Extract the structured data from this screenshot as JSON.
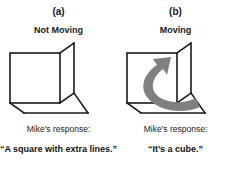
{
  "figure": {
    "background_color": "#ffffff",
    "line_color": "#1a1a1a",
    "arrow_color": "#808080"
  },
  "panels": [
    {
      "letter": "(a)",
      "condition": "Not Moving",
      "cube_icon": "static-cube-icon",
      "has_rotation_arrow": false,
      "response_label": "Mike's response:",
      "response_quote": "“A square with extra lines.”"
    },
    {
      "letter": "(b)",
      "condition": "Moving",
      "cube_icon": "rotating-cube-icon",
      "has_rotation_arrow": true,
      "rotation_arrow_icon": "curved-rotation-arrow-icon",
      "response_label": "Mike's response:",
      "response_quote": "“It’s a cube.”"
    }
  ]
}
